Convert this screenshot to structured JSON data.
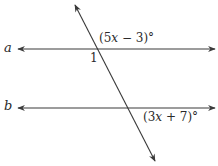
{
  "diagram": {
    "type": "parallel-lines-cut-by-transversal",
    "colors": {
      "stroke": "#3a3a3a",
      "text": "#2a2a2a",
      "background": "#ffffff"
    },
    "lines": [
      {
        "id": "a",
        "label": "a",
        "y": 49,
        "x1": 16,
        "x2": 216
      },
      {
        "id": "b",
        "label": "b",
        "y": 108,
        "x1": 16,
        "x2": 216
      }
    ],
    "transversal": {
      "x1": 74,
      "y1": 3,
      "x2": 156,
      "y2": 163
    },
    "angles": [
      {
        "id": "angle-a",
        "expr_prefix": "(5",
        "var": "x",
        "expr_suffix": " − 3)°",
        "position": "above-right of intersection a"
      },
      {
        "id": "angle-1",
        "label": "1",
        "position": "below-left of intersection a"
      },
      {
        "id": "angle-b",
        "expr_prefix": "(3",
        "var": "x",
        "expr_suffix": " + 7)°",
        "position": "below-right of intersection b"
      }
    ]
  }
}
